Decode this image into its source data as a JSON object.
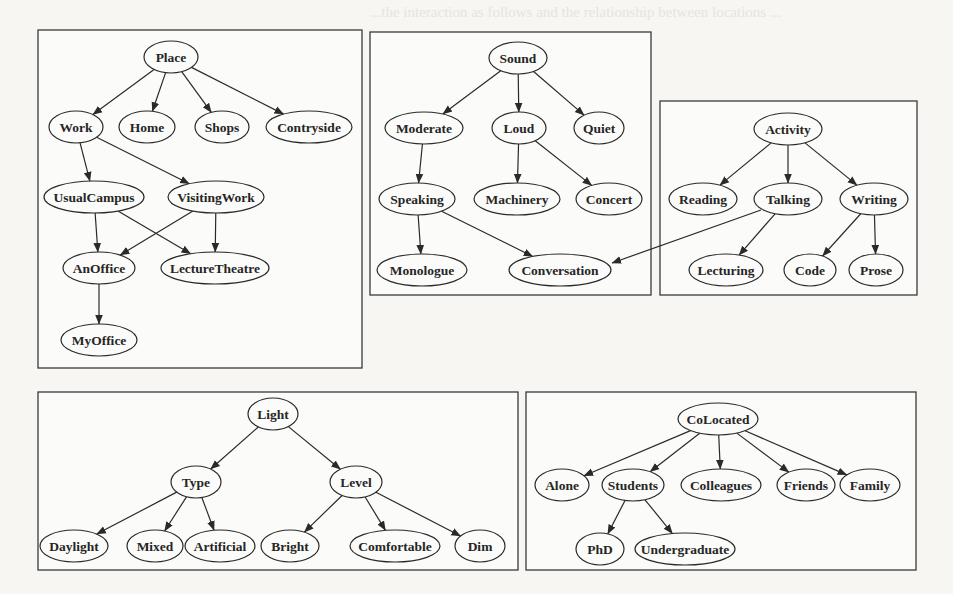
{
  "background_text": {
    "lines": [
      "...the interaction as follows and the relationship between locations ...",
      "...work. The hierarchical relationships ...",
      "",
      "5.2  Inference and Querying",
      "",
      "... generated ... context ...",
      "... the ... hierarchy ... level ... ",
      "... technique ... sensor ... information ... ",
      "... However ... provide ... context ... ",
      "... a ... simple ... ",
      "... and ... the ... the test ... ",
      "... presented ... ",
      "... are ... and that the ... ",
      "... ... "
    ]
  },
  "panels": [
    {
      "id": "place",
      "box": [
        38,
        30,
        324,
        338
      ],
      "nodes": [
        {
          "id": "Place",
          "label": "Place",
          "x": 171,
          "y": 57,
          "rx": 27
        },
        {
          "id": "Work",
          "label": "Work",
          "x": 76,
          "y": 127,
          "rx": 27
        },
        {
          "id": "Home",
          "label": "Home",
          "x": 147,
          "y": 127,
          "rx": 28
        },
        {
          "id": "Shops",
          "label": "Shops",
          "x": 222,
          "y": 127,
          "rx": 27
        },
        {
          "id": "Contryside",
          "label": "Contryside",
          "x": 309,
          "y": 127,
          "rx": 43
        },
        {
          "id": "UsualCampus",
          "label": "UsualCampus",
          "x": 94,
          "y": 197,
          "rx": 50
        },
        {
          "id": "VisitingWork",
          "label": "VisitingWork",
          "x": 216,
          "y": 197,
          "rx": 48
        },
        {
          "id": "AnOffice",
          "label": "AnOffice",
          "x": 99,
          "y": 268,
          "rx": 36
        },
        {
          "id": "LectureTheatre",
          "label": "LectureTheatre",
          "x": 215,
          "y": 268,
          "rx": 54
        },
        {
          "id": "MyOffice",
          "label": "MyOffice",
          "x": 99,
          "y": 340,
          "rx": 38
        }
      ],
      "edges": [
        [
          "Place",
          "Work"
        ],
        [
          "Place",
          "Home"
        ],
        [
          "Place",
          "Shops"
        ],
        [
          "Place",
          "Contryside"
        ],
        [
          "Work",
          "UsualCampus"
        ],
        [
          "Work",
          "VisitingWork"
        ],
        [
          "UsualCampus",
          "AnOffice"
        ],
        [
          "UsualCampus",
          "LectureTheatre"
        ],
        [
          "VisitingWork",
          "AnOffice"
        ],
        [
          "VisitingWork",
          "LectureTheatre"
        ],
        [
          "AnOffice",
          "MyOffice"
        ]
      ]
    },
    {
      "id": "sound",
      "box": [
        370,
        32,
        281,
        263
      ],
      "nodes": [
        {
          "id": "Sound",
          "label": "Sound",
          "x": 518,
          "y": 58,
          "rx": 29
        },
        {
          "id": "Moderate",
          "label": "Moderate",
          "x": 424,
          "y": 128,
          "rx": 39
        },
        {
          "id": "Loud",
          "label": "Loud",
          "x": 519,
          "y": 128,
          "rx": 27
        },
        {
          "id": "Quiet",
          "label": "Quiet",
          "x": 599,
          "y": 128,
          "rx": 25
        },
        {
          "id": "Speaking",
          "label": "Speaking",
          "x": 417,
          "y": 199,
          "rx": 38
        },
        {
          "id": "Machinery",
          "label": "Machinery",
          "x": 517,
          "y": 199,
          "rx": 43
        },
        {
          "id": "Concert",
          "label": "Concert",
          "x": 609,
          "y": 199,
          "rx": 33
        },
        {
          "id": "Monologue",
          "label": "Monologue",
          "x": 422,
          "y": 270,
          "rx": 45
        },
        {
          "id": "Conversation",
          "label": "Conversation",
          "x": 560,
          "y": 270,
          "rx": 51
        }
      ],
      "edges": [
        [
          "Sound",
          "Moderate"
        ],
        [
          "Sound",
          "Loud"
        ],
        [
          "Sound",
          "Quiet"
        ],
        [
          "Moderate",
          "Speaking"
        ],
        [
          "Loud",
          "Machinery"
        ],
        [
          "Loud",
          "Concert"
        ],
        [
          "Speaking",
          "Monologue"
        ],
        [
          "Speaking",
          "Conversation"
        ]
      ]
    },
    {
      "id": "activity",
      "box": [
        660,
        101,
        257,
        194
      ],
      "nodes": [
        {
          "id": "Activity",
          "label": "Activity",
          "x": 788,
          "y": 129,
          "rx": 34
        },
        {
          "id": "Reading",
          "label": "Reading",
          "x": 703,
          "y": 199,
          "rx": 34
        },
        {
          "id": "Talking",
          "label": "Talking",
          "x": 788,
          "y": 199,
          "rx": 34
        },
        {
          "id": "Writing",
          "label": "Writing",
          "x": 874,
          "y": 199,
          "rx": 34
        },
        {
          "id": "Lecturing",
          "label": "Lecturing",
          "x": 726,
          "y": 270,
          "rx": 37
        },
        {
          "id": "Code",
          "label": "Code",
          "x": 810,
          "y": 270,
          "rx": 26
        },
        {
          "id": "Prose",
          "label": "Prose",
          "x": 876,
          "y": 270,
          "rx": 27
        }
      ],
      "edges": [
        [
          "Activity",
          "Reading"
        ],
        [
          "Activity",
          "Talking"
        ],
        [
          "Activity",
          "Writing"
        ],
        [
          "Talking",
          "Lecturing"
        ],
        [
          "Writing",
          "Code"
        ],
        [
          "Writing",
          "Prose"
        ]
      ]
    },
    {
      "id": "light",
      "box": [
        38,
        392,
        480,
        178
      ],
      "nodes": [
        {
          "id": "Light",
          "label": "Light",
          "x": 273,
          "y": 414,
          "rx": 25
        },
        {
          "id": "Type",
          "label": "Type",
          "x": 196,
          "y": 482,
          "rx": 25
        },
        {
          "id": "Level",
          "label": "Level",
          "x": 356,
          "y": 482,
          "rx": 26
        },
        {
          "id": "Daylight",
          "label": "Daylight",
          "x": 74,
          "y": 546,
          "rx": 34
        },
        {
          "id": "Mixed",
          "label": "Mixed",
          "x": 155,
          "y": 546,
          "rx": 28
        },
        {
          "id": "Artificial",
          "label": "Artificial",
          "x": 220,
          "y": 546,
          "rx": 35
        },
        {
          "id": "Bright",
          "label": "Bright",
          "x": 290,
          "y": 546,
          "rx": 29
        },
        {
          "id": "Comfortable",
          "label": "Comfortable",
          "x": 395,
          "y": 546,
          "rx": 45
        },
        {
          "id": "Dim",
          "label": "Dim",
          "x": 480,
          "y": 546,
          "rx": 25
        }
      ],
      "edges": [
        [
          "Light",
          "Type"
        ],
        [
          "Light",
          "Level"
        ],
        [
          "Type",
          "Daylight"
        ],
        [
          "Type",
          "Mixed"
        ],
        [
          "Type",
          "Artificial"
        ],
        [
          "Level",
          "Bright"
        ],
        [
          "Level",
          "Comfortable"
        ],
        [
          "Level",
          "Dim"
        ]
      ]
    },
    {
      "id": "colocated",
      "box": [
        526,
        392,
        390,
        178
      ],
      "nodes": [
        {
          "id": "CoLocated",
          "label": "CoLocated",
          "x": 718,
          "y": 419,
          "rx": 40
        },
        {
          "id": "Alone",
          "label": "Alone",
          "x": 562,
          "y": 485,
          "rx": 27
        },
        {
          "id": "Students",
          "label": "Students",
          "x": 633,
          "y": 485,
          "rx": 31
        },
        {
          "id": "Colleagues",
          "label": "Colleagues",
          "x": 721,
          "y": 485,
          "rx": 40
        },
        {
          "id": "Friends",
          "label": "Friends",
          "x": 806,
          "y": 485,
          "rx": 29
        },
        {
          "id": "Family",
          "label": "Family",
          "x": 870,
          "y": 485,
          "rx": 30
        },
        {
          "id": "PhD",
          "label": "PhD",
          "x": 600,
          "y": 549,
          "rx": 24
        },
        {
          "id": "Undergraduate",
          "label": "Undergraduate",
          "x": 685,
          "y": 549,
          "rx": 50
        }
      ],
      "edges": [
        [
          "CoLocated",
          "Alone"
        ],
        [
          "CoLocated",
          "Students"
        ],
        [
          "CoLocated",
          "Colleagues"
        ],
        [
          "CoLocated",
          "Friends"
        ],
        [
          "CoLocated",
          "Family"
        ],
        [
          "Students",
          "PhD"
        ],
        [
          "Students",
          "Undergraduate"
        ]
      ]
    }
  ],
  "cross_edges": [
    {
      "from": "Talking",
      "to": "Conversation",
      "path": [
        [
          761,
          210
        ],
        [
          700,
          232
        ],
        [
          612,
          263
        ]
      ]
    }
  ],
  "node_ry": 16
}
